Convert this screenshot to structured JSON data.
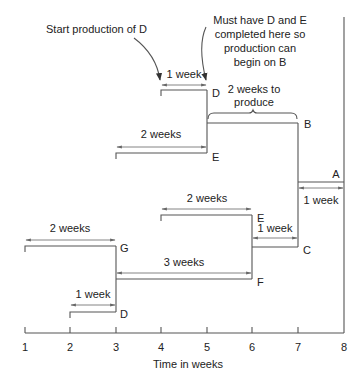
{
  "annotations": {
    "start_d": "Start production of D",
    "must_have_line1": "Must have D and E",
    "must_have_line2": "completed here so",
    "must_have_line3": "production can",
    "must_have_line4": "begin on B",
    "two_weeks_produce_line1": "2 weeks to",
    "two_weeks_produce_line2": "produce"
  },
  "nodes": {
    "d_top": "D",
    "e_top": "E",
    "b": "B",
    "a": "A",
    "e_mid": "E",
    "c": "C",
    "g": "G",
    "f": "F",
    "d_bottom": "D"
  },
  "durations": {
    "d_top": "1 week",
    "e_top": "2 weeks",
    "a": "1 week",
    "e_mid": "2 weeks",
    "c": "1 week",
    "g": "2 weeks",
    "f": "3 weeks",
    "d_bottom": "1 week"
  },
  "axis": {
    "label": "Time in weeks",
    "ticks": [
      "1",
      "2",
      "3",
      "4",
      "5",
      "6",
      "7",
      "8"
    ]
  },
  "colors": {
    "line": "#555555",
    "text": "#222222",
    "background": "#ffffff"
  }
}
